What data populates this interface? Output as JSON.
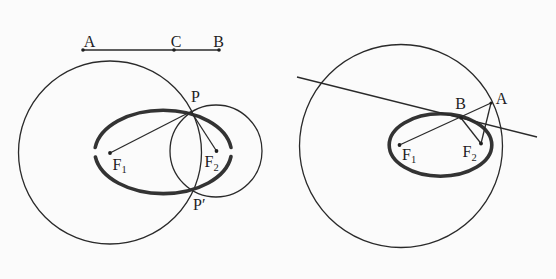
{
  "colors": {
    "background": "#fbfbfb",
    "stroke": "#2a2a2a",
    "ellipse_stroke": "#333333"
  },
  "left_figure": {
    "segment": {
      "label_a": "A",
      "label_c": "C",
      "label_b": "B"
    },
    "point_p": "P",
    "point_p_prime": "P′",
    "focus_1": {
      "base": "F",
      "sub": "1"
    },
    "focus_2": {
      "base": "F",
      "sub": "2"
    }
  },
  "right_figure": {
    "point_a": "A",
    "point_b": "B",
    "focus_1": {
      "base": "F",
      "sub": "1"
    },
    "focus_2": {
      "base": "F",
      "sub": "2"
    }
  }
}
